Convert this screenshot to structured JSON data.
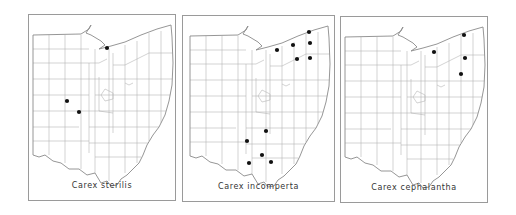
{
  "figure": {
    "outline_color": "#8a8a8a",
    "county_line_color": "#b5b5b5",
    "dot_color": "#111111"
  },
  "panels": [
    {
      "species": "Carex sterilis",
      "box": {
        "x": 28,
        "y": 14,
        "w": 148,
        "h": 187
      },
      "dots": [
        [
          78,
          33
        ],
        [
          38,
          86
        ],
        [
          50,
          97
        ]
      ]
    },
    {
      "species": "Carex incomperta",
      "box": {
        "x": 182,
        "y": 15,
        "w": 153,
        "h": 187
      },
      "dots": [
        [
          94,
          34
        ],
        [
          110,
          29
        ],
        [
          126,
          16
        ],
        [
          127,
          27
        ],
        [
          114,
          43
        ],
        [
          127,
          42
        ],
        [
          83,
          115
        ],
        [
          64,
          125
        ],
        [
          79,
          139
        ],
        [
          66,
          147
        ],
        [
          88,
          146
        ]
      ]
    },
    {
      "species": "Carex cephalantha",
      "box": {
        "x": 340,
        "y": 16,
        "w": 148,
        "h": 187
      },
      "dots": [
        [
          93,
          35
        ],
        [
          123,
          18
        ],
        [
          124,
          41
        ],
        [
          120,
          57
        ]
      ]
    }
  ]
}
